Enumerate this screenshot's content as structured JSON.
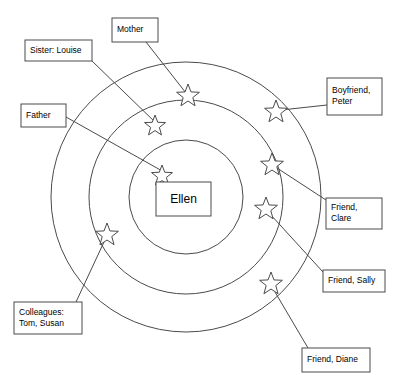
{
  "diagram": {
    "type": "concentric-circles-social-network",
    "center": {
      "label": "Ellen",
      "box": {
        "x": 156,
        "y": 182,
        "w": 55,
        "h": 34
      }
    },
    "rings": [
      {
        "name": "inner-ring",
        "cx": 186,
        "cy": 197,
        "r": 57
      },
      {
        "name": "middle-ring",
        "cx": 186,
        "cy": 197,
        "r": 97
      },
      {
        "name": "outer-ring",
        "cx": 186,
        "cy": 197,
        "r": 135
      }
    ],
    "stars": [
      {
        "name": "star-father",
        "cx": 162,
        "cy": 176,
        "r": 11,
        "ring": "inner"
      },
      {
        "name": "star-sister",
        "cx": 155,
        "cy": 126,
        "r": 11,
        "ring": "middle"
      },
      {
        "name": "star-mother",
        "cx": 188,
        "cy": 96,
        "r": 12,
        "ring": "outer"
      },
      {
        "name": "star-boyfriend",
        "cx": 276,
        "cy": 112,
        "r": 12,
        "ring": "outer"
      },
      {
        "name": "star-clare",
        "cx": 272,
        "cy": 165,
        "r": 12,
        "ring": "middle"
      },
      {
        "name": "star-sally",
        "cx": 266,
        "cy": 209,
        "r": 12,
        "ring": "middle"
      },
      {
        "name": "star-diane",
        "cx": 271,
        "cy": 284,
        "r": 12,
        "ring": "outer"
      },
      {
        "name": "star-colleagues",
        "cx": 107,
        "cy": 235,
        "r": 12,
        "ring": "middle"
      }
    ],
    "labels": [
      {
        "id": "mother",
        "name": "label-mother",
        "lines": [
          "Mother"
        ],
        "box": {
          "x": 112,
          "y": 18,
          "w": 46,
          "h": 24
        },
        "leader": [
          {
            "x": 146,
            "y": 42
          },
          {
            "x": 186,
            "y": 93
          }
        ]
      },
      {
        "id": "sister",
        "name": "label-sister-louise",
        "lines": [
          "Sister: Louise"
        ],
        "box": {
          "x": 25,
          "y": 40,
          "w": 67,
          "h": 21
        },
        "leader": [
          {
            "x": 92,
            "y": 61
          },
          {
            "x": 156,
            "y": 123
          }
        ]
      },
      {
        "id": "father",
        "name": "label-father",
        "lines": [
          "Father"
        ],
        "box": {
          "x": 21,
          "y": 104,
          "w": 45,
          "h": 23
        },
        "leader": [
          {
            "x": 66,
            "y": 117
          },
          {
            "x": 164,
            "y": 172
          }
        ]
      },
      {
        "id": "boyfriend",
        "name": "label-boyfriend-peter",
        "lines": [
          "Boyfriend,",
          "Peter"
        ],
        "box": {
          "x": 327,
          "y": 78,
          "w": 55,
          "h": 37
        },
        "leader": [
          {
            "x": 327,
            "y": 105
          },
          {
            "x": 281,
            "y": 110
          }
        ]
      },
      {
        "id": "clare",
        "name": "label-friend-clare",
        "lines": [
          "Friend,",
          "Clare"
        ],
        "box": {
          "x": 326,
          "y": 198,
          "w": 56,
          "h": 31
        },
        "leader": [
          {
            "x": 326,
            "y": 200
          },
          {
            "x": 277,
            "y": 168
          }
        ]
      },
      {
        "id": "sally",
        "name": "label-friend-sally",
        "lines": [
          "Friend, Sally"
        ],
        "box": {
          "x": 323,
          "y": 270,
          "w": 62,
          "h": 22
        },
        "leader": [
          {
            "x": 323,
            "y": 272
          },
          {
            "x": 270,
            "y": 214
          }
        ]
      },
      {
        "id": "diane",
        "name": "label-friend-diane",
        "lines": [
          "Friend, Diane"
        ],
        "box": {
          "x": 302,
          "y": 348,
          "w": 68,
          "h": 24
        },
        "leader": [
          {
            "x": 308,
            "y": 348
          },
          {
            "x": 275,
            "y": 292
          }
        ]
      },
      {
        "id": "colleagues",
        "name": "label-colleagues",
        "lines": [
          "Colleagues:",
          "Tom, Susan"
        ],
        "box": {
          "x": 14,
          "y": 302,
          "w": 68,
          "h": 32
        },
        "leader": [
          {
            "x": 76,
            "y": 302
          },
          {
            "x": 104,
            "y": 242
          }
        ]
      }
    ],
    "colors": {
      "stroke": "#4a4a4a",
      "text": "#000000",
      "background": "#ffffff"
    }
  }
}
